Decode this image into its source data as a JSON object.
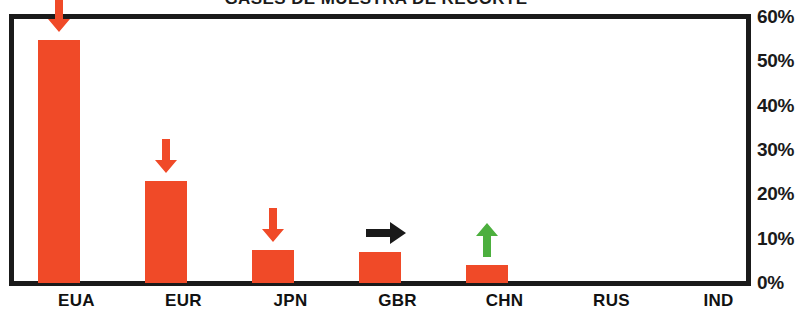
{
  "chart_data": {
    "type": "bar",
    "title": "GASES DE MUESTRA DE RECORTE",
    "xlabel": "",
    "ylabel": "",
    "categories": [
      "EUA",
      "EUR",
      "JPN",
      "GBR",
      "CHN",
      "RUS",
      "IND"
    ],
    "values": [
      55.3,
      23.2,
      7.5,
      7.0,
      4.0,
      0,
      0
    ],
    "series": [
      {
        "name": "Participacion",
        "values": [
          55.3,
          23.2,
          7.5,
          7.0,
          4.0,
          0,
          0
        ]
      }
    ],
    "ylim": [
      0,
      60
    ],
    "yticks": [
      0,
      10,
      20,
      30,
      40,
      50,
      60
    ],
    "ytick_labels": [
      "0%",
      "10%",
      "20%",
      "30%",
      "40%",
      "50%",
      "60%"
    ],
    "grid": false,
    "legend": "none",
    "bar_color": "#F04A28",
    "axis_color": "#1a1a1a",
    "background": "#ffffff",
    "annotations": [
      {
        "category": "EUA",
        "direction": "down",
        "color": "#F04A28",
        "icon": "arrow-down-icon"
      },
      {
        "category": "EUR",
        "direction": "down",
        "color": "#F04A28",
        "icon": "arrow-down-icon"
      },
      {
        "category": "JPN",
        "direction": "down",
        "color": "#F04A28",
        "icon": "arrow-down-icon"
      },
      {
        "category": "GBR",
        "direction": "right",
        "color": "#1a1a1a",
        "icon": "arrow-right-icon"
      },
      {
        "category": "CHN",
        "direction": "up",
        "color": "#4CAF3E",
        "icon": "arrow-up-icon"
      }
    ]
  }
}
